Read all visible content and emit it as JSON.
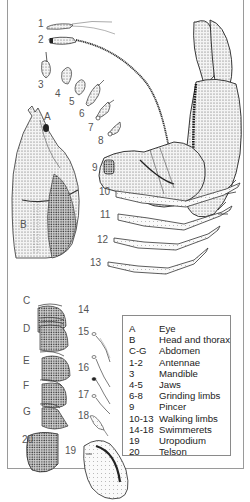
{
  "figure": {
    "part_labels": {
      "A": "A",
      "B": "B",
      "C": "C",
      "D": "D",
      "E": "E",
      "F": "F",
      "G": "G",
      "n1": "1",
      "n2": "2",
      "n3": "3",
      "n4": "4",
      "n5": "5",
      "n6": "6",
      "n7": "7",
      "n8": "8",
      "n9": "9",
      "n10": "10",
      "n11": "11",
      "n12": "12",
      "n13": "13",
      "n14": "14",
      "n15": "15",
      "n16": "16",
      "n17": "17",
      "n18": "18",
      "n19": "19",
      "n20": "20"
    }
  },
  "legend": {
    "items": [
      {
        "key": "A",
        "label": "Eye"
      },
      {
        "key": "B",
        "label": "Head and thorax"
      },
      {
        "key": "C-G",
        "label": "Abdomen"
      },
      {
        "key": "1-2",
        "label": "Antennae"
      },
      {
        "key": "3",
        "label": "Mandible"
      },
      {
        "key": "4-5",
        "label": "Jaws"
      },
      {
        "key": "6-8",
        "label": "Grinding limbs"
      },
      {
        "key": "9",
        "label": "Pincer"
      },
      {
        "key": "10-13",
        "label": "Walking limbs"
      },
      {
        "key": "14-18",
        "label": "Swimmerets"
      },
      {
        "key": "19",
        "label": "Uropodium"
      },
      {
        "key": "20",
        "label": "Telson"
      }
    ]
  }
}
